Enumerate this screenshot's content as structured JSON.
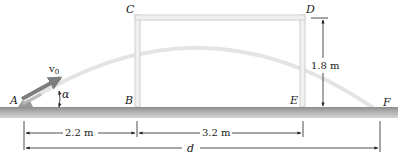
{
  "diagram": {
    "points": {
      "A": "A",
      "B": "B",
      "C": "C",
      "D": "D",
      "E": "E",
      "F": "F"
    },
    "symbols": {
      "velocity": "v",
      "velocity_subscript": "0",
      "angle": "α"
    },
    "dimensions": {
      "AB": "2.2 m",
      "BE": "3.2 m",
      "height_DE": "1.8 m",
      "total": "d"
    },
    "colors": {
      "ground": "#9a9a9a",
      "frame": "#d8d8d8",
      "trajectory": "#e2e2e2",
      "velocity_arrow": "#7d7d7d",
      "lines": "#222222"
    }
  }
}
